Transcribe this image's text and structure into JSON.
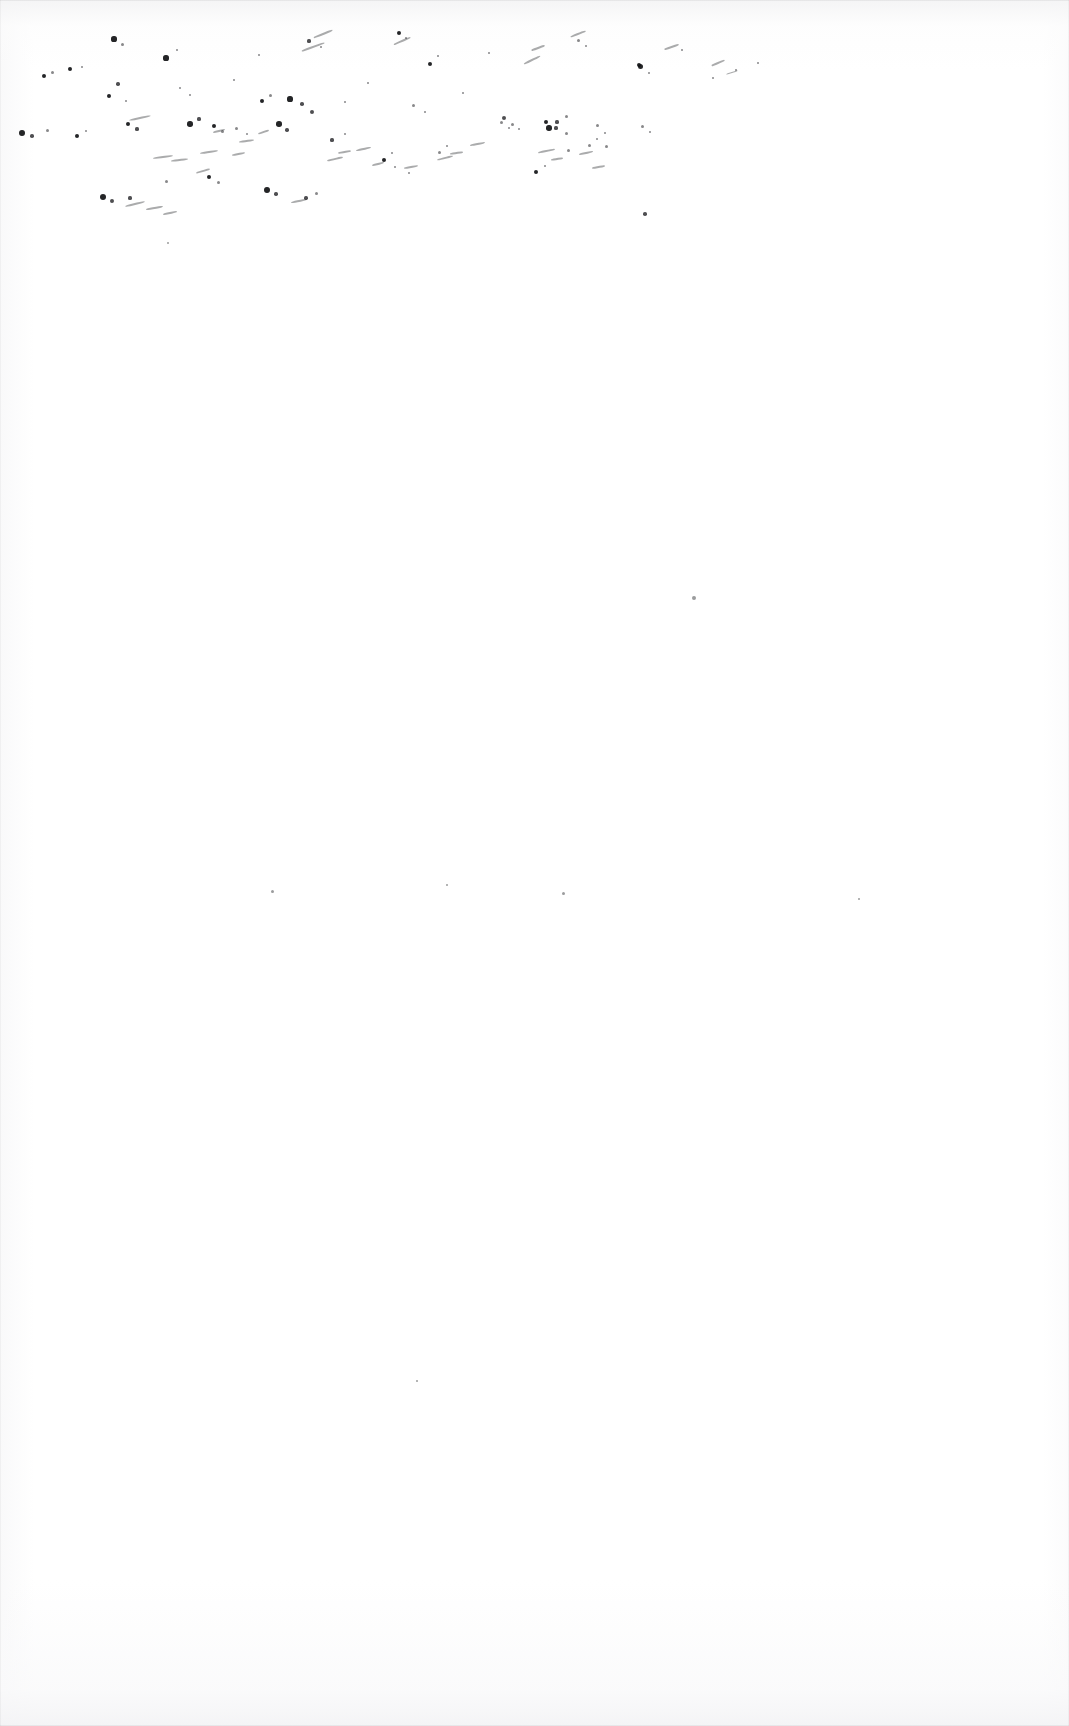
{
  "page": {
    "kind": "scanned-document-page",
    "visible_text": "",
    "text_blocks": [],
    "width_px": 1069,
    "height_px": 1726,
    "background_color": "#ffffff",
    "ink_color": "#111215",
    "paper_tone_color": "#f6f6f7",
    "edge_line_color": "#eaeaec"
  },
  "artifacts": {
    "label": "scan-noise",
    "description": "Ink splatter and toner speckles",
    "region": "upper band of the page",
    "band_top_px": 20,
    "band_bottom_px": 225,
    "dot_count": 96,
    "streak_count": 34,
    "stray_marks_below_band": 7
  },
  "speckles": {
    "dots": [
      [
        114,
        39,
        2.6
      ],
      [
        122,
        44,
        1.5
      ],
      [
        166,
        58,
        2.6
      ],
      [
        177,
        50,
        1.4
      ],
      [
        259,
        55,
        1.3
      ],
      [
        309,
        41,
        1.6
      ],
      [
        321,
        47,
        1.2
      ],
      [
        399,
        33,
        2.2
      ],
      [
        406,
        38,
        1.4
      ],
      [
        430,
        64,
        2.1
      ],
      [
        438,
        56,
        1.1
      ],
      [
        489,
        53,
        1.2
      ],
      [
        578,
        40,
        1.5
      ],
      [
        586,
        46,
        1.1
      ],
      [
        639,
        65,
        2.4
      ],
      [
        682,
        50,
        1.2
      ],
      [
        713,
        78,
        1.4
      ],
      [
        736,
        70,
        1.3
      ],
      [
        758,
        63,
        1.2
      ],
      [
        44,
        76,
        2.3
      ],
      [
        52,
        72,
        1.5
      ],
      [
        70,
        69,
        2.1
      ],
      [
        82,
        67,
        1.3
      ],
      [
        109,
        96,
        2.2
      ],
      [
        118,
        84,
        1.7
      ],
      [
        126,
        101,
        1.4
      ],
      [
        180,
        88,
        1.3
      ],
      [
        190,
        95,
        1.2
      ],
      [
        234,
        80,
        1.4
      ],
      [
        262,
        101,
        2.4
      ],
      [
        270,
        95,
        1.5
      ],
      [
        290,
        99,
        2.6
      ],
      [
        302,
        104,
        1.8
      ],
      [
        312,
        112,
        2.0
      ],
      [
        345,
        102,
        1.4
      ],
      [
        368,
        83,
        1.4
      ],
      [
        413,
        105,
        1.5
      ],
      [
        425,
        112,
        1.3
      ],
      [
        463,
        93,
        1.3
      ],
      [
        504,
        118,
        2.0
      ],
      [
        512,
        124,
        1.5
      ],
      [
        546,
        122,
        2.4
      ],
      [
        556,
        128,
        1.6
      ],
      [
        566,
        116,
        1.5
      ],
      [
        597,
        125,
        1.5
      ],
      [
        605,
        133,
        1.3
      ],
      [
        640,
        66,
        2.5
      ],
      [
        649,
        73,
        1.4
      ],
      [
        22,
        133,
        2.9
      ],
      [
        32,
        136,
        1.8
      ],
      [
        47,
        130,
        1.5
      ],
      [
        77,
        136,
        2.3
      ],
      [
        86,
        131,
        1.4
      ],
      [
        128,
        124,
        2.2
      ],
      [
        137,
        129,
        1.6
      ],
      [
        190,
        124,
        2.7
      ],
      [
        199,
        119,
        1.6
      ],
      [
        214,
        126,
        2.1
      ],
      [
        222,
        131,
        1.5
      ],
      [
        236,
        128,
        1.5
      ],
      [
        247,
        134,
        1.3
      ],
      [
        279,
        124,
        2.8
      ],
      [
        287,
        130,
        1.7
      ],
      [
        332,
        140,
        1.6
      ],
      [
        345,
        134,
        1.4
      ],
      [
        384,
        160,
        2.1
      ],
      [
        392,
        153,
        1.4
      ],
      [
        439,
        152,
        1.5
      ],
      [
        447,
        146,
        1.3
      ],
      [
        501,
        122,
        1.5
      ],
      [
        509,
        128,
        1.4
      ],
      [
        519,
        129,
        1.4
      ],
      [
        549,
        128,
        2.7
      ],
      [
        557,
        122,
        1.6
      ],
      [
        566,
        133,
        1.5
      ],
      [
        589,
        145,
        1.5
      ],
      [
        597,
        139,
        1.4
      ],
      [
        606,
        146,
        1.5
      ],
      [
        642,
        126,
        1.5
      ],
      [
        650,
        132,
        1.3
      ],
      [
        267,
        190,
        2.9
      ],
      [
        276,
        194,
        1.7
      ],
      [
        209,
        177,
        2.2
      ],
      [
        218,
        182,
        1.5
      ],
      [
        103,
        197,
        3.2
      ],
      [
        112,
        201,
        1.9
      ],
      [
        130,
        198,
        1.6
      ],
      [
        166,
        181,
        1.5
      ],
      [
        306,
        198,
        1.7
      ],
      [
        316,
        193,
        1.5
      ],
      [
        395,
        167,
        1.3
      ],
      [
        409,
        173,
        1.2
      ],
      [
        536,
        172,
        2.2
      ],
      [
        545,
        166,
        1.4
      ],
      [
        568,
        150,
        1.5
      ],
      [
        645,
        214,
        1.8
      ]
    ],
    "streaks": [
      [
        129,
        117,
        22,
        2.4,
        -12
      ],
      [
        153,
        156,
        20,
        2.1,
        -8
      ],
      [
        171,
        159,
        17,
        1.9,
        -6
      ],
      [
        196,
        170,
        14,
        1.8,
        -16
      ],
      [
        200,
        151,
        18,
        2.0,
        -9
      ],
      [
        213,
        130,
        12,
        1.7,
        -14
      ],
      [
        232,
        153,
        13,
        1.7,
        -11
      ],
      [
        239,
        140,
        15,
        1.8,
        -7
      ],
      [
        258,
        131,
        11,
        1.6,
        -18
      ],
      [
        301,
        46,
        24,
        1.6,
        -20
      ],
      [
        313,
        33,
        20,
        1.5,
        -22
      ],
      [
        327,
        158,
        16,
        1.8,
        -13
      ],
      [
        338,
        151,
        13,
        1.7,
        -9
      ],
      [
        356,
        148,
        15,
        1.8,
        -12
      ],
      [
        372,
        163,
        12,
        1.7,
        -15
      ],
      [
        393,
        40,
        18,
        1.5,
        -24
      ],
      [
        404,
        166,
        14,
        1.7,
        -10
      ],
      [
        437,
        157,
        16,
        1.8,
        -14
      ],
      [
        450,
        152,
        13,
        1.7,
        -8
      ],
      [
        470,
        143,
        15,
        1.8,
        -11
      ],
      [
        523,
        59,
        18,
        1.6,
        -26
      ],
      [
        531,
        47,
        14,
        1.5,
        -20
      ],
      [
        538,
        150,
        17,
        1.9,
        -12
      ],
      [
        551,
        158,
        12,
        1.7,
        -9
      ],
      [
        570,
        33,
        16,
        1.5,
        -21
      ],
      [
        579,
        152,
        14,
        1.7,
        -13
      ],
      [
        592,
        166,
        13,
        1.7,
        -10
      ],
      [
        664,
        46,
        15,
        1.5,
        -19
      ],
      [
        711,
        62,
        14,
        1.5,
        -23
      ],
      [
        726,
        72,
        12,
        1.4,
        -17
      ],
      [
        125,
        203,
        20,
        2.0,
        -14
      ],
      [
        146,
        207,
        17,
        1.9,
        -10
      ],
      [
        163,
        212,
        14,
        1.8,
        -12
      ],
      [
        291,
        200,
        16,
        1.8,
        -11
      ]
    ],
    "stray": [
      [
        694,
        598,
        1.9
      ],
      [
        272,
        891,
        1.5
      ],
      [
        447,
        885,
        1.3
      ],
      [
        563,
        893,
        1.5
      ],
      [
        859,
        899,
        1.4
      ],
      [
        417,
        1381,
        1.3
      ],
      [
        168,
        243,
        1.2
      ]
    ]
  }
}
